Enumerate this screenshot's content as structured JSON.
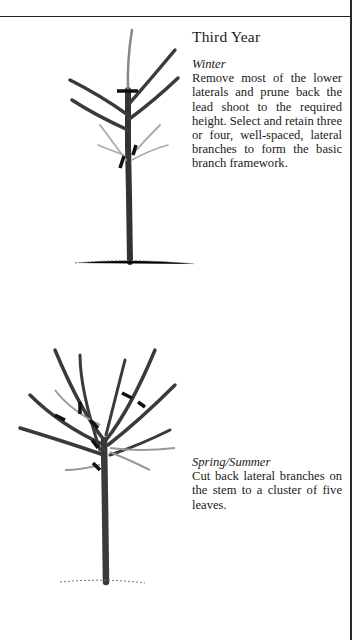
{
  "page": {
    "section_title": "Third Year",
    "steps": [
      {
        "season": "Winter",
        "instruction": "Remove most of the lower laterals and prune back the lead shoot to the required height. Select and retain three or four, well-spaced, lateral branches to form the basic branch framework."
      },
      {
        "season": "Spring/Summer",
        "instruction": "Cut back lateral branches on the stem to a cluster of five leaves."
      }
    ],
    "illustrations": [
      {
        "name": "tree-winter-pruning",
        "description": "Young tree with lead shoot and laterals marked with cut lines"
      },
      {
        "name": "tree-summer-pruning",
        "description": "Branched tree with cut marks on laterals"
      }
    ],
    "colors": {
      "ink": "#1a1a1a",
      "branch": "#3a3a3a",
      "light-branch": "#9a9a9a",
      "paper": "#ffffff"
    }
  }
}
